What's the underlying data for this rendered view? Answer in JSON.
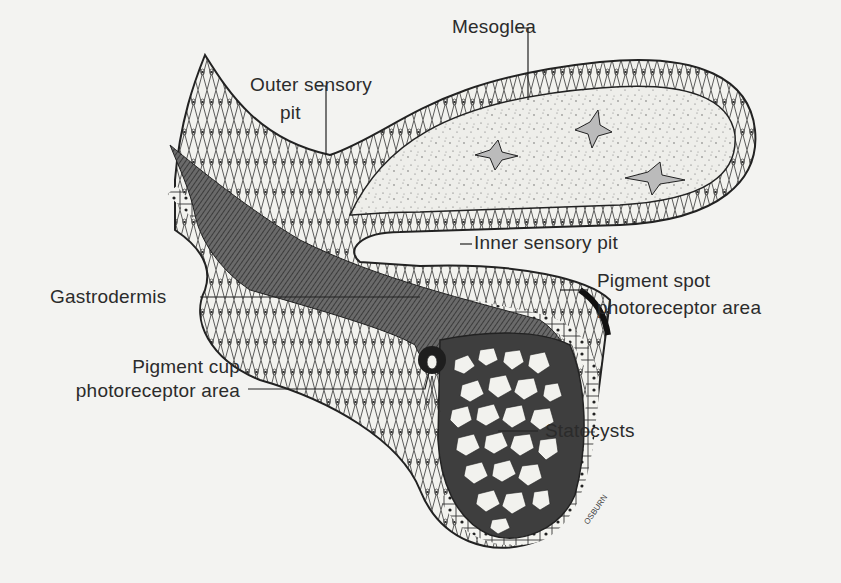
{
  "figure": {
    "labels": {
      "mesoglea": "Mesoglea",
      "outer_sensory_pit_line1": "Outer sensory",
      "outer_sensory_pit_line2": "pit",
      "inner_sensory_pit": "Inner sensory pit",
      "pigment_spot_line1": "Pigment spot",
      "pigment_spot_line2": "photoreceptor area",
      "gastrodermis": "Gastrodermis",
      "pigment_cup_line1": "Pigment cup",
      "pigment_cup_line2": "photoreceptor area",
      "statocysts": "Statocysts"
    },
    "colors": {
      "background": "#f3f3f1",
      "ink": "#2a2a2a",
      "mesoglea_fill": "#ecebe6",
      "gastric_cavity": "#5a5a5a"
    }
  }
}
